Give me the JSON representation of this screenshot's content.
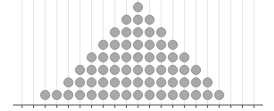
{
  "chart_data": {
    "type": "scatter",
    "subtype": "dot-plot",
    "title": "",
    "xlabel": "",
    "ylabel": "",
    "x_ticks_count": 21,
    "x": [
      2,
      3,
      4,
      5,
      6,
      7,
      8,
      9,
      10,
      11,
      12,
      13,
      14,
      15,
      16,
      17
    ],
    "counts": [
      1,
      1,
      2,
      3,
      4,
      5,
      6,
      7,
      8,
      7,
      6,
      5,
      4,
      3,
      2,
      1
    ],
    "total_dots": 65,
    "grid": {
      "vertical": true,
      "horizontal": false
    },
    "legend": null
  },
  "style": {
    "dot_fill": "#a9a9a9",
    "dot_stroke": "#8a8a8a",
    "grid_color": "#e6e6e6",
    "axis_color": "#555555"
  }
}
